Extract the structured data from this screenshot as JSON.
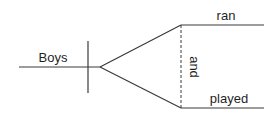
{
  "diagram": {
    "type": "sentence-diagram",
    "style": "Reed-Kellogg",
    "subject": "Boys",
    "conjunction": "and",
    "predicates": [
      "ran",
      "played"
    ],
    "colors": {
      "line": "#3a3a3a",
      "text": "#1f1f1f",
      "background": "#ffffff"
    }
  }
}
